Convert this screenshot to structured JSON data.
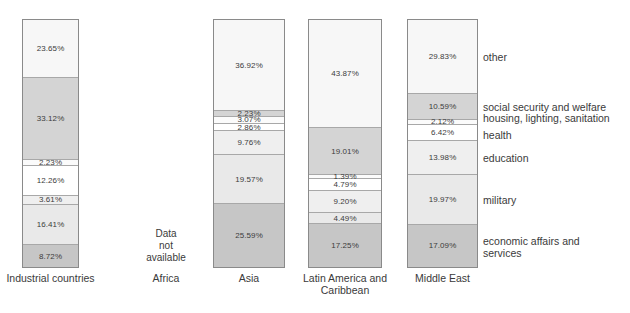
{
  "chart_data": {
    "type": "bar",
    "subtype": "100% stacked column",
    "title": "",
    "xlabel": "",
    "ylabel": "",
    "ylim": [
      0,
      100
    ],
    "grid": false,
    "legend_position": "right",
    "categories": [
      "Industrial countries",
      "Africa",
      "Asia",
      "Latin America and Caribbean",
      "Middle East"
    ],
    "series": [
      {
        "name": "other",
        "color": "#f7f7f7",
        "values": [
          23.65,
          null,
          36.92,
          43.87,
          29.83
        ]
      },
      {
        "name": "social security and welfare",
        "color": "#d4d4d4",
        "values": [
          33.12,
          null,
          2.23,
          19.01,
          10.59
        ]
      },
      {
        "name": "housing, lighting, sanitation",
        "color": "#fbfbfb",
        "values": [
          2.23,
          null,
          3.07,
          1.39,
          2.12
        ]
      },
      {
        "name": "health",
        "color": "#ffffff",
        "values": [
          12.26,
          null,
          2.86,
          4.79,
          6.42
        ]
      },
      {
        "name": "education",
        "color": "#efefef",
        "values": [
          3.61,
          null,
          9.76,
          9.2,
          13.98
        ]
      },
      {
        "name": "military",
        "color": "#e9e9e9",
        "values": [
          16.41,
          null,
          19.57,
          4.49,
          19.97
        ]
      },
      {
        "name": "economic affairs and services",
        "color": "#c6c6c6",
        "values": [
          8.72,
          null,
          25.59,
          17.25,
          17.09
        ]
      }
    ],
    "value_labels": {
      "industrial_countries": [
        "23.65%",
        "33.12%",
        "2.23%",
        "12.26%",
        "3.61%",
        "16.41%",
        "8.72%"
      ],
      "asia": [
        "36.92%",
        "2.23%",
        "3.07%",
        "2.86%",
        "9.76%",
        "19.57%",
        "25.59%"
      ],
      "latin_america_and_caribbean": [
        "43.87%",
        "19.01%",
        "1.39%",
        "4.79%",
        "9.20%",
        "4.49%",
        "17.25%"
      ],
      "middle_east": [
        "29.83%",
        "10.59%",
        "2.12%",
        "6.42%",
        "13.98%",
        "19.97%",
        "17.09%"
      ]
    }
  },
  "columns": [
    {
      "key": "industrial-countries",
      "label": "Industrial countries",
      "has_data": true,
      "segments": [
        {
          "name": "other",
          "label": "23.65%",
          "pct": 23.65,
          "color": "#f7f7f7"
        },
        {
          "name": "social security and welfare",
          "label": "33.12%",
          "pct": 33.12,
          "color": "#d4d4d4"
        },
        {
          "name": "housing, lighting, sanitation",
          "label": "2.23%",
          "pct": 2.23,
          "color": "#fbfbfb"
        },
        {
          "name": "health",
          "label": "12.26%",
          "pct": 12.26,
          "color": "#ffffff"
        },
        {
          "name": "education",
          "label": "3.61%",
          "pct": 3.61,
          "color": "#efefef"
        },
        {
          "name": "military",
          "label": "16.41%",
          "pct": 16.41,
          "color": "#e9e9e9"
        },
        {
          "name": "economic affairs and services",
          "label": "8.72%",
          "pct": 8.72,
          "color": "#c6c6c6"
        }
      ]
    },
    {
      "key": "africa",
      "label": "Africa",
      "has_data": false,
      "no_data_text": "Data\nnot available",
      "segments": []
    },
    {
      "key": "asia",
      "label": "Asia",
      "has_data": true,
      "segments": [
        {
          "name": "other",
          "label": "36.92%",
          "pct": 36.92,
          "color": "#f7f7f7"
        },
        {
          "name": "social security and welfare",
          "label": "2.23%",
          "pct": 2.23,
          "color": "#d4d4d4"
        },
        {
          "name": "housing, lighting, sanitation",
          "label": "3.07%",
          "pct": 3.07,
          "color": "#fbfbfb"
        },
        {
          "name": "health",
          "label": "2.86%",
          "pct": 2.86,
          "color": "#ffffff"
        },
        {
          "name": "education",
          "label": "9.76%",
          "pct": 9.76,
          "color": "#efefef"
        },
        {
          "name": "military",
          "label": "19.57%",
          "pct": 19.57,
          "color": "#e9e9e9"
        },
        {
          "name": "economic affairs and services",
          "label": "25.59%",
          "pct": 25.59,
          "color": "#c6c6c6"
        }
      ]
    },
    {
      "key": "latin-america-and-caribbean",
      "label": "Latin America and\nCaribbean",
      "has_data": true,
      "segments": [
        {
          "name": "other",
          "label": "43.87%",
          "pct": 43.87,
          "color": "#f7f7f7"
        },
        {
          "name": "social security and welfare",
          "label": "19.01%",
          "pct": 19.01,
          "color": "#d4d4d4"
        },
        {
          "name": "housing, lighting, sanitation",
          "label": "1.39%",
          "pct": 1.39,
          "color": "#fbfbfb"
        },
        {
          "name": "health",
          "label": "4.79%",
          "pct": 4.79,
          "color": "#ffffff"
        },
        {
          "name": "education",
          "label": "9.20%",
          "pct": 9.2,
          "color": "#efefef"
        },
        {
          "name": "military",
          "label": "4.49%",
          "pct": 4.49,
          "color": "#e9e9e9"
        },
        {
          "name": "economic affairs and services",
          "label": "17.25%",
          "pct": 17.25,
          "color": "#c6c6c6"
        }
      ]
    },
    {
      "key": "middle-east",
      "label": "Middle East",
      "has_data": true,
      "segments": [
        {
          "name": "other",
          "label": "29.83%",
          "pct": 29.83,
          "color": "#f7f7f7"
        },
        {
          "name": "social security and welfare",
          "label": "10.59%",
          "pct": 10.59,
          "color": "#d4d4d4"
        },
        {
          "name": "housing, lighting, sanitation",
          "label": "2.12%",
          "pct": 2.12,
          "color": "#fbfbfb"
        },
        {
          "name": "health",
          "label": "6.42%",
          "pct": 6.42,
          "color": "#ffffff"
        },
        {
          "name": "education",
          "label": "13.98%",
          "pct": 13.98,
          "color": "#efefef"
        },
        {
          "name": "military",
          "label": "19.97%",
          "pct": 19.97,
          "color": "#e9e9e9"
        },
        {
          "name": "economic affairs and services",
          "label": "17.09%",
          "pct": 17.09,
          "color": "#c6c6c6"
        }
      ]
    }
  ],
  "legend": {
    "items": [
      {
        "name": "other",
        "label": "other"
      },
      {
        "name": "social security and welfare",
        "label": "social security and welfare"
      },
      {
        "name": "housing, lighting, sanitation",
        "label": "housing, lighting, sanitation"
      },
      {
        "name": "health",
        "label": "health"
      },
      {
        "name": "education",
        "label": "education"
      },
      {
        "name": "military",
        "label": "military"
      },
      {
        "name": "economic affairs and services",
        "label": "economic affairs and\nservices"
      }
    ]
  },
  "geometry": {
    "bar_top": 19,
    "bar_height": 249,
    "label_top": 272,
    "columns_x": [
      22,
      140,
      213,
      308,
      407
    ],
    "columns_w": [
      57,
      52,
      72,
      74,
      71
    ],
    "legend_x": 483
  }
}
